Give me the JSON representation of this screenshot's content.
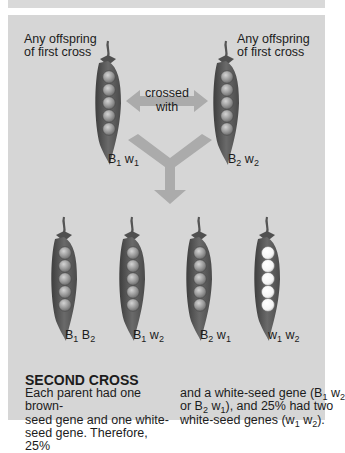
{
  "parents": {
    "left": {
      "label_line1": "Any offspring",
      "label_line2": "of first cross",
      "gene1": "B",
      "gene1_sub": "1",
      "gene2": "w",
      "gene2_sub": "1",
      "seed_color": "brown"
    },
    "right": {
      "label_line1": "Any offspring",
      "label_line2": "of first cross",
      "gene1": "B",
      "gene1_sub": "2",
      "gene2": "w",
      "gene2_sub": "2",
      "seed_color": "brown"
    }
  },
  "cross_arrow": {
    "line1": "crossed",
    "line2": "with"
  },
  "offspring": [
    {
      "gene1": "B",
      "gene1_sub": "1",
      "gene2": "B",
      "gene2_sub": "2",
      "seed_color": "brown"
    },
    {
      "gene1": "B",
      "gene1_sub": "1",
      "gene2": "w",
      "gene2_sub": "2",
      "seed_color": "brown"
    },
    {
      "gene1": "B",
      "gene1_sub": "2",
      "gene2": "w",
      "gene2_sub": "1",
      "seed_color": "brown"
    },
    {
      "gene1": "w",
      "gene1_sub": "1",
      "gene2": "w",
      "gene2_sub": "2",
      "seed_color": "white"
    }
  ],
  "caption": {
    "heading": "SECOND CROSS",
    "col1": {
      "line1": "Each parent had one brown-",
      "line2": "seed gene and one white-",
      "line3": "seed gene. Therefore, 25%"
    },
    "col2": {
      "line1_a": "and a white-seed gene (B",
      "line1_sub1": "1",
      "line1_b": " w",
      "line1_sub2": "2",
      "line2_a": "or B",
      "line2_sub1": "2",
      "line2_b": " w",
      "line2_sub2": "1",
      "line2_c": "), and 25% had two",
      "line3_a": "white-seed genes (w",
      "line3_sub1": "1",
      "line3_b": " w",
      "line3_sub2": "2",
      "line3_c": ")."
    }
  },
  "colors": {
    "panel": "#d6d6d6",
    "pod": "#5a5a5a",
    "brown_seed": "#9a9a9a",
    "white_seed": "#f8f8f8",
    "arrow": "#a9a9a9"
  }
}
